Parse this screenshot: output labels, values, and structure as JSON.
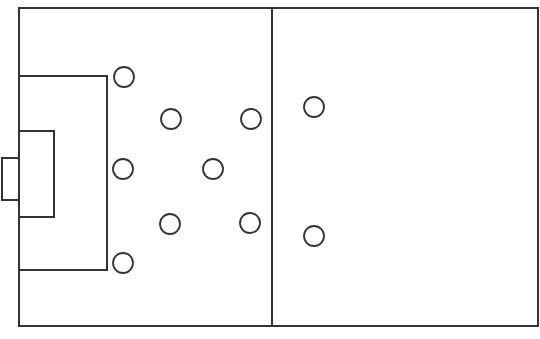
{
  "diagram": {
    "type": "soccer-half-field-formation",
    "line_color": "#333333",
    "background": "#ffffff",
    "field": {
      "x": 19,
      "y": 8,
      "width": 519,
      "height": 318
    },
    "halfway_line": {
      "x": 272,
      "y1": 8,
      "y2": 326
    },
    "penalty_area": {
      "x": 19,
      "y": 76,
      "width": 88,
      "height": 194
    },
    "goal_area": {
      "x": 19,
      "y": 131,
      "width": 35,
      "height": 86
    },
    "goal": {
      "x": 2,
      "y": 158,
      "width": 17,
      "height": 42
    },
    "player_radius": 10,
    "players": [
      {
        "id": "p1",
        "cx": 124,
        "cy": 77
      },
      {
        "id": "p2",
        "cx": 171,
        "cy": 119
      },
      {
        "id": "p3",
        "cx": 251,
        "cy": 119
      },
      {
        "id": "p4",
        "cx": 314,
        "cy": 107
      },
      {
        "id": "p5",
        "cx": 123,
        "cy": 169
      },
      {
        "id": "p6",
        "cx": 213,
        "cy": 169
      },
      {
        "id": "p7",
        "cx": 170,
        "cy": 224
      },
      {
        "id": "p8",
        "cx": 250,
        "cy": 223
      },
      {
        "id": "p9",
        "cx": 314,
        "cy": 236
      },
      {
        "id": "p10",
        "cx": 123,
        "cy": 263
      }
    ]
  }
}
